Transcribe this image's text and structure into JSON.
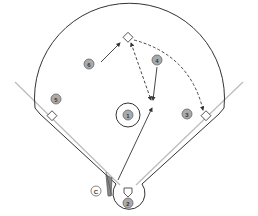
{
  "diagram": {
    "type": "baseball-field-play",
    "colors": {
      "outline": "#333333",
      "foul_line": "#bbbbbb",
      "player_fill": "#aaaaaa",
      "player_stroke": "#666666",
      "text": "#333333"
    },
    "players": [
      {
        "label": "1",
        "position": "pitcher",
        "x": 128,
        "y": 115
      },
      {
        "label": "2",
        "position": "catcher",
        "x": 128,
        "y": 203
      },
      {
        "label": "3",
        "position": "first-base",
        "x": 187,
        "y": 114
      },
      {
        "label": "4",
        "position": "second-base",
        "x": 157,
        "y": 60
      },
      {
        "label": "5",
        "position": "third-base",
        "x": 56,
        "y": 99
      },
      {
        "label": "6",
        "position": "shortstop",
        "x": 89,
        "y": 64
      }
    ],
    "coach": {
      "label": "C",
      "x": 96,
      "y": 191
    },
    "bases": {
      "second": {
        "x": 128,
        "y": 38
      },
      "first": {
        "x": 206,
        "y": 115
      },
      "third": {
        "x": 52,
        "y": 115
      },
      "home": {
        "x": 128,
        "y": 188
      }
    }
  }
}
